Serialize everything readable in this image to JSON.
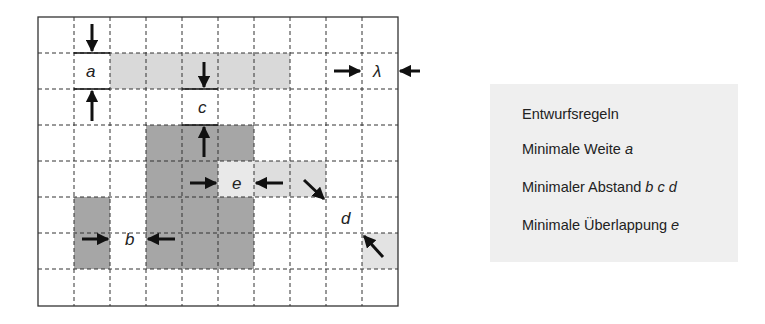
{
  "diagram": {
    "title": "Entwurfsregeln",
    "grid": {
      "columns": 10,
      "rows": 8,
      "cell_px": 36,
      "origin_x": 38,
      "origin_y": 17
    },
    "colors": {
      "light_fill": "#d9d9d9",
      "dark_fill": "#a6a6a6",
      "cell_light": "#e6e6e6",
      "grid_line": "#222222",
      "arrow": "#111111"
    },
    "shapes": [
      {
        "name": "wide-light-bar",
        "col": 2,
        "row": 1,
        "w": 5,
        "h": 1,
        "fill": "light"
      },
      {
        "name": "big-dark-block",
        "col": 3,
        "row": 3,
        "w": 3,
        "h": 4,
        "fill": "dark"
      },
      {
        "name": "narrow-dark-block",
        "col": 1,
        "row": 5,
        "w": 1,
        "h": 2,
        "fill": "dark"
      },
      {
        "name": "overlap-light-bar",
        "col": 5,
        "row": 4,
        "w": 3,
        "h": 1,
        "fill": "light"
      },
      {
        "name": "corner-light-block",
        "col": 9,
        "row": 6,
        "w": 1,
        "h": 1,
        "fill": "light"
      }
    ],
    "labels": {
      "a": "a",
      "b": "b",
      "c": "c",
      "d": "d",
      "e": "e",
      "lambda": "λ"
    }
  },
  "legend": {
    "heading": "Entwurfsregeln",
    "rules": [
      {
        "text": "Minimale Weite ",
        "symbols": "a"
      },
      {
        "text": "Minimaler Abstand ",
        "symbols": "b c d"
      },
      {
        "text": "Minimale Überlappung ",
        "symbols": "e"
      }
    ]
  }
}
